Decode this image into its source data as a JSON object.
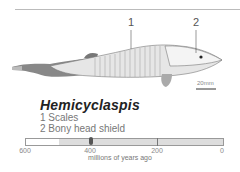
{
  "figure": {
    "title": "Hemicyclaspis",
    "callouts": [
      {
        "number": "1",
        "label": "Scales"
      },
      {
        "number": "2",
        "label": "Bony head shield"
      }
    ],
    "scale_bar": "20mm"
  },
  "legend": {
    "item1": "1  Scales",
    "item2": "2  Bony head shield"
  },
  "timeline": {
    "ticks": [
      "600",
      "400",
      "200",
      "0"
    ],
    "caption": "millions of years ago",
    "range_start_ma": 600,
    "range_end_ma": 0,
    "shaded_from_ma": 500,
    "marker_ma": 400
  },
  "colors": {
    "shade": "#dddddd",
    "marker": "#555555",
    "title": "#222222"
  }
}
